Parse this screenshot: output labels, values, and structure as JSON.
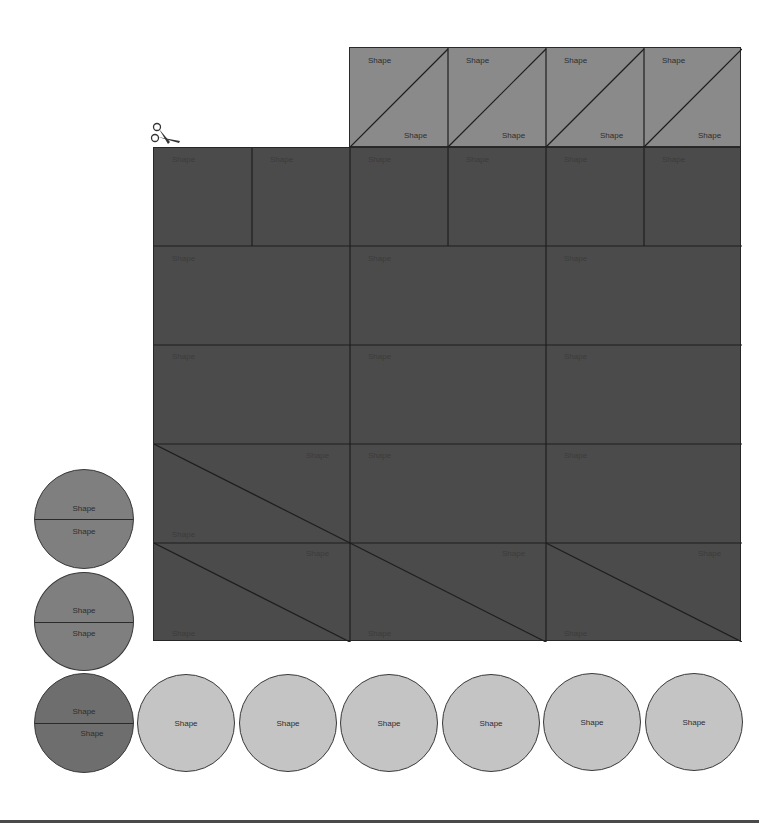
{
  "colors": {
    "top_row_fill": "#8a8a8a",
    "grid_fill": "#4b4b4b",
    "split_circle_fill": "#7f7f7f",
    "split_circle_dark_fill": "#6e6e6e",
    "plain_circle_fill": "#c4c4c4",
    "line": "#1e1e1e",
    "label_on_light": "#2e2e2e",
    "label_on_dark": "#3c3c3c"
  },
  "icons": {
    "scissors": "scissors-icon"
  },
  "top_row": {
    "tiles": [
      {
        "label_top": "Shape",
        "label_bottom": "Shape"
      },
      {
        "label_top": "Shape",
        "label_bottom": "Shape"
      },
      {
        "label_top": "Shape",
        "label_bottom": "Shape"
      },
      {
        "label_top": "Shape",
        "label_bottom": "Shape"
      }
    ]
  },
  "grid": {
    "row1": [
      "Shape",
      "Shape",
      "Shape",
      "Shape",
      "Shape",
      "Shape"
    ],
    "row2": [
      "Shape",
      "Shape",
      "Shape"
    ],
    "row3": [
      "Shape",
      "Shape",
      "Shape"
    ],
    "row4": {
      "triangle": {
        "label_top": "Shape",
        "label_bottom": "Shape"
      },
      "squares": [
        "Shape",
        "Shape"
      ]
    },
    "row5": [
      {
        "label_top": "Shape",
        "label_bottom": "Shape"
      },
      {
        "label_top": "Shape",
        "label_bottom": "Shape"
      },
      {
        "label_top": "Shape",
        "label_bottom": "Shape"
      }
    ]
  },
  "split_circles": [
    {
      "label_top": "Shape",
      "label_bottom": "Shape"
    },
    {
      "label_top": "Shape",
      "label_bottom": "Shape"
    },
    {
      "label_top": "Shape",
      "label_bottom": "Shape"
    }
  ],
  "plain_circles": [
    "Shape",
    "Shape",
    "Shape",
    "Shape",
    "Shape",
    "Shape"
  ]
}
